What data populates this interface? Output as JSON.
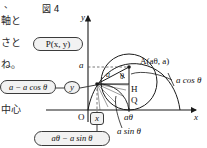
{
  "figure": {
    "title": "図 4",
    "caption_lines": [
      "軸と",
      "さと",
      "ね。",
      "中心"
    ],
    "side_text_top": "、",
    "axes": {
      "x_label": "x",
      "y_label": "y",
      "origin_label": "O",
      "y_tick_label": "a",
      "x_tick_label": "aθ"
    },
    "points": {
      "A": "A(aθ, a)",
      "P": "P(x, y)",
      "H": "H",
      "Q": "Q"
    },
    "inline_labels": {
      "radius": "a",
      "angle": "θ",
      "a_cos_theta": "a cos θ",
      "a_sin_theta": "a sin θ"
    },
    "callouts": {
      "y_component": "a − a cos θ",
      "x_component": "aθ − a sin θ",
      "boxed_y": "y",
      "boxed_x": "x"
    },
    "colors": {
      "ink": "#1a1a1a",
      "box_fill": "#f2f2f2",
      "box_stroke": "#3b3b3b",
      "page": "#ffffff"
    }
  }
}
